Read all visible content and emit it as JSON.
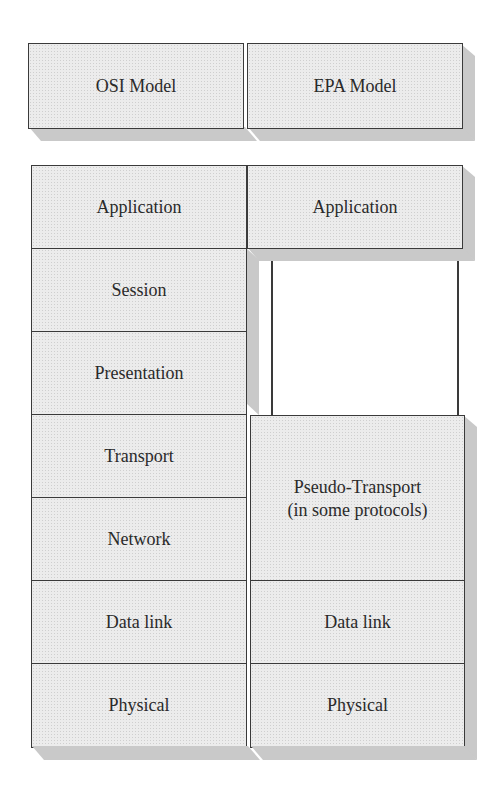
{
  "headers": {
    "osi": "OSI Model",
    "epa": "EPA Model"
  },
  "osi_layers": [
    {
      "label": "Application"
    },
    {
      "label": "Session"
    },
    {
      "label": "Presentation"
    },
    {
      "label": "Transport"
    },
    {
      "label": "Network"
    },
    {
      "label": "Data link"
    },
    {
      "label": "Physical"
    }
  ],
  "epa_layers": [
    {
      "label": "Application"
    },
    {
      "label": "Pseudo-Transport\n(in some protocols)"
    },
    {
      "label": "Data link"
    },
    {
      "label": "Physical"
    }
  ],
  "colors": {
    "fill": "#ececec",
    "shade": "#c9c9c9",
    "border": "#3a3a3a",
    "text": "#2a2a2a"
  }
}
